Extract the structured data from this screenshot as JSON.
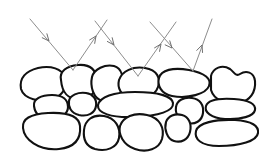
{
  "figure": {
    "caption": "",
    "background_color": "#ffffff",
    "width": 268,
    "height": 163
  },
  "style": {
    "stone_outline_color": "#111111",
    "stone_fill_color": "#ffffff",
    "stone_stroke_width": 2.1,
    "ray_color": "#8d8d8d",
    "ray_head_color": "#6f6f6f",
    "ray_stroke_width": 1.0
  },
  "rays": {
    "label": "light-rays",
    "count": 6,
    "pairs": [
      {
        "name": "ray-pair-left",
        "incident": {
          "name": "incident-ray-1",
          "from": [
            30,
            19
          ],
          "to": [
            73,
            70
          ],
          "arrowhead_at": [
            49,
            41
          ],
          "direction": "down-right"
        },
        "reflected": {
          "name": "reflected-ray-1",
          "from": [
            73,
            70
          ],
          "to": [
            107,
            20
          ],
          "arrowhead_at": [
            96,
            36
          ],
          "direction": "up-right"
        },
        "hit_point": [
          73,
          70
        ]
      },
      {
        "name": "ray-pair-middle",
        "incident": {
          "name": "incident-ray-2",
          "from": [
            95,
            21
          ],
          "to": [
            138,
            76
          ],
          "arrowhead_at": [
            114,
            45
          ],
          "direction": "down-right"
        },
        "reflected": {
          "name": "reflected-ray-2",
          "from": [
            138,
            76
          ],
          "to": [
            176,
            22
          ],
          "arrowhead_at": [
            161,
            44
          ],
          "direction": "up-right"
        },
        "hit_point": [
          138,
          76
        ]
      },
      {
        "name": "ray-pair-right",
        "incident": {
          "name": "incident-ray-3",
          "from": [
            150,
            22
          ],
          "to": [
            193,
            71
          ],
          "arrowhead_at": [
            172,
            48
          ],
          "direction": "down-right"
        },
        "reflected": {
          "name": "reflected-ray-3",
          "from": [
            193,
            71
          ],
          "to": [
            212,
            19
          ],
          "arrowhead_at": [
            202,
            45
          ],
          "direction": "up-right"
        },
        "hit_point": [
          193,
          71
        ]
      }
    ]
  },
  "wall": {
    "label": "stone-wall",
    "rows": [
      {
        "name": "stone-row-top",
        "stones": [
          {
            "name": "stone-top-1",
            "path": "M21,89 C19,78 26,71 38,68 C51,65 62,69 65,77 C68,85 64,95 53,99 C40,103 24,99 21,89 Z"
          },
          {
            "name": "stone-top-2",
            "path": "M61,80 C59,71 67,66 78,65 C90,64 96,70 97,80 C98,90 92,98 80,99 C68,100 62,92 61,80 Z"
          },
          {
            "name": "stone-top-3",
            "path": "M92,77 C94,69 105,64 114,66 C122,68 124,78 122,88 C120,98 113,103 103,101 C93,99 90,86 92,77 Z"
          },
          {
            "name": "stone-top-4",
            "path": "M119,80 C122,71 133,66 145,68 C157,70 161,78 158,87 C155,96 143,100 131,98 C121,96 117,88 119,80 Z"
          },
          {
            "name": "stone-top-5",
            "path": "M159,78 C161,70 173,67 189,70 C205,73 212,79 209,86 C206,94 188,99 172,96 C161,94 157,85 159,78 Z"
          },
          {
            "name": "stone-top-6-notched",
            "path": "M211,76 C213,68 222,64 230,69 C234,72 236,77 240,74 C246,70 254,72 255,81 C256,92 250,101 239,103 C226,105 214,100 211,90 Z"
          }
        ]
      },
      {
        "name": "stone-row-middle",
        "stones": [
          {
            "name": "stone-mid-1",
            "path": "M34,106 C33,99 41,95 52,95 C63,95 68,100 68,107 C68,114 61,119 50,119 C39,119 35,113 34,106 Z"
          },
          {
            "name": "stone-mid-2",
            "path": "M69,101 C70,95 78,92 86,93 C93,94 97,99 96,106 C95,113 88,117 79,115 C71,113 68,107 69,101 Z"
          },
          {
            "name": "stone-mid-3-long",
            "path": "M98,105 C100,97 113,92 135,92 C158,92 172,96 173,103 C174,111 159,116 134,117 C111,118 97,113 98,105 Z"
          },
          {
            "name": "stone-mid-4",
            "path": "M176,107 C177,100 184,97 192,98 C200,99 204,105 203,113 C202,121 195,125 187,123 C179,121 175,114 176,107 Z"
          },
          {
            "name": "stone-mid-5",
            "path": "M206,106 C208,100 219,98 234,99 C249,100 256,104 255,110 C254,116 241,120 225,119 C211,118 204,112 206,106 Z"
          }
        ]
      },
      {
        "name": "stone-row-bottom",
        "stones": [
          {
            "name": "stone-bot-1-large",
            "path": "M23,128 C22,119 30,114 48,113 C68,112 79,116 80,126 C81,137 77,147 59,149 C38,151 24,139 23,128 Z"
          },
          {
            "name": "stone-bot-2",
            "path": "M84,130 C85,120 93,114 104,116 C115,118 121,127 119,138 C117,148 106,152 95,149 C85,146 83,139 84,130 Z"
          },
          {
            "name": "stone-bot-3",
            "path": "M120,126 C123,117 134,112 147,115 C160,118 165,128 162,139 C159,149 147,153 135,149 C123,145 118,134 120,126 Z"
          },
          {
            "name": "stone-bot-4",
            "path": "M166,122 C168,116 175,113 182,115 C189,117 192,124 190,132 C188,140 181,143 174,141 C167,139 164,129 166,122 Z"
          },
          {
            "name": "stone-bot-5-long",
            "path": "M196,131 C198,123 215,119 235,120 C252,121 259,126 258,133 C257,141 240,146 219,146 C201,146 194,139 196,131 Z"
          }
        ]
      }
    ]
  }
}
